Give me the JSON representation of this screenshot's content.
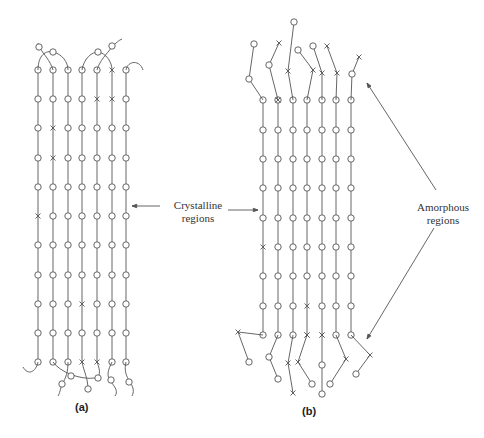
{
  "labels": {
    "crystalline": [
      "Crystalline",
      "regions"
    ],
    "amorphous": [
      "Amorphous",
      "regions"
    ],
    "caption_a": "(a)",
    "caption_b": "(b)"
  },
  "colors": {
    "line": "#555555",
    "background": "#ffffff",
    "text": "#333333"
  },
  "panel_a": {
    "columns_x": [
      38,
      53,
      68,
      82,
      97,
      112,
      126
    ],
    "rows_y": [
      70,
      99,
      128,
      158,
      187,
      216,
      245,
      275,
      304,
      333,
      362
    ],
    "cross_markers": [
      [
        5,
        0
      ],
      [
        4,
        1
      ],
      [
        5,
        1
      ],
      [
        1,
        2
      ],
      [
        1,
        3
      ],
      [
        0,
        5
      ],
      [
        3,
        8
      ],
      [
        3,
        10
      ],
      [
        4,
        10
      ]
    ]
  },
  "panel_b": {
    "columns_x": [
      263,
      278,
      293,
      307,
      322,
      336,
      351
    ],
    "rows_y": [
      100,
      130,
      159,
      188,
      218,
      247,
      276,
      306,
      335
    ],
    "cross_markers": [
      [
        0,
        5
      ],
      [
        3,
        7
      ],
      [
        1,
        0
      ],
      [
        1,
        1
      ],
      [
        3,
        8
      ],
      [
        4,
        8
      ]
    ]
  }
}
